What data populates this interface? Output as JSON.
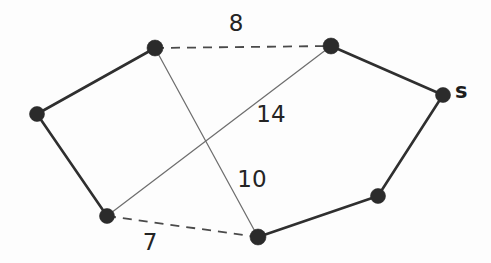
{
  "figure": {
    "type": "graph-diagram",
    "title": "",
    "width": 491,
    "height": 263,
    "background_color": "#fdfdfd"
  },
  "colors": {
    "node_fill": "#2b2b2b",
    "edge_solid": "#2f2f2f",
    "edge_thin": "#6e6e6e",
    "edge_dashed": "#4a4a4a",
    "label_text": "#242424"
  },
  "nodes": [
    {
      "id": "n_left",
      "label": "",
      "x": 37,
      "y": 114,
      "r": 7.5
    },
    {
      "id": "n_topleft",
      "label": "",
      "x": 155,
      "y": 48,
      "r": 8.0
    },
    {
      "id": "n_topright",
      "label": "",
      "x": 331,
      "y": 46,
      "r": 8.0
    },
    {
      "id": "n_s",
      "label": "s",
      "x": 443,
      "y": 95,
      "r": 7.5
    },
    {
      "id": "n_bottomleft",
      "label": "",
      "x": 107,
      "y": 216,
      "r": 7.5
    },
    {
      "id": "n_bottomcenter",
      "label": "",
      "x": 258,
      "y": 237,
      "r": 8.0
    },
    {
      "id": "n_bottomright",
      "label": "",
      "x": 378,
      "y": 196,
      "r": 7.5
    }
  ],
  "node_labels": [
    {
      "for": "n_s",
      "text": "s",
      "x": 455,
      "y": 92
    }
  ],
  "edges": [
    {
      "id": "e_left_topleft",
      "from": "n_left",
      "to": "n_topleft",
      "style": "solid",
      "weight": null
    },
    {
      "id": "e_left_bottomleft",
      "from": "n_left",
      "to": "n_bottomleft",
      "style": "solid",
      "weight": null
    },
    {
      "id": "e_topright_s",
      "from": "n_topright",
      "to": "n_s",
      "style": "solid",
      "weight": null
    },
    {
      "id": "e_s_bottomright",
      "from": "n_s",
      "to": "n_bottomright",
      "style": "solid",
      "weight": null
    },
    {
      "id": "e_bottomright_bottomcenter",
      "from": "n_bottomright",
      "to": "n_bottomcenter",
      "style": "solid",
      "weight": null
    },
    {
      "id": "e_topleft_topright",
      "from": "n_topleft",
      "to": "n_topright",
      "style": "dashed",
      "weight": "8"
    },
    {
      "id": "e_bottomleft_bottomcenter",
      "from": "n_bottomleft",
      "to": "n_bottomcenter",
      "style": "dashed",
      "weight": "7"
    },
    {
      "id": "e_bottomleft_topright",
      "from": "n_bottomleft",
      "to": "n_topright",
      "style": "thin",
      "weight": "14"
    },
    {
      "id": "e_topleft_bottomcenter",
      "from": "n_topleft",
      "to": "n_bottomcenter",
      "style": "thin",
      "weight": "10"
    }
  ],
  "edge_labels": [
    {
      "for": "e_topleft_topright",
      "text": "8",
      "x": 236,
      "y": 24
    },
    {
      "for": "e_bottomleft_topright",
      "text": "14",
      "x": 271,
      "y": 115
    },
    {
      "for": "e_topleft_bottomcenter",
      "text": "10",
      "x": 252,
      "y": 180
    },
    {
      "for": "e_bottomleft_bottomcenter",
      "text": "7",
      "x": 150,
      "y": 243
    }
  ]
}
